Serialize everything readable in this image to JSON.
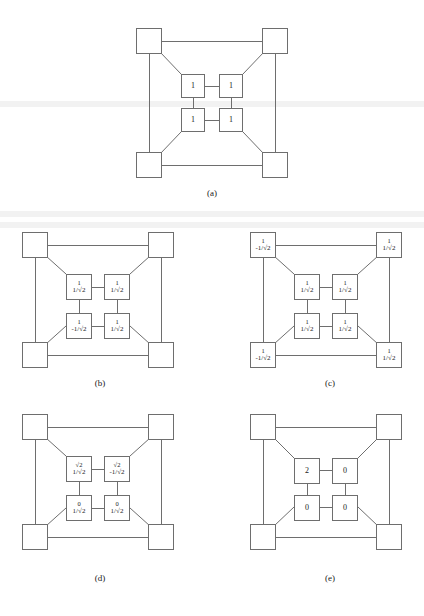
{
  "figure": {
    "background_color": "#ffffff",
    "line_color": "#6e6e6e",
    "text_color": "#1a1a1a"
  },
  "panels": [
    {
      "id": "a",
      "caption": "(a)",
      "corners": [
        {
          "position": "top-left",
          "label": ""
        },
        {
          "position": "top-right",
          "label": ""
        },
        {
          "position": "bottom-left",
          "label": ""
        },
        {
          "position": "bottom-right",
          "label": ""
        }
      ],
      "inner": [
        {
          "position": "top-left",
          "top": "",
          "bottom": "1"
        },
        {
          "position": "top-right",
          "top": "",
          "bottom": "1"
        },
        {
          "position": "bottom-left",
          "top": "",
          "bottom": "1"
        },
        {
          "position": "bottom-right",
          "top": "",
          "bottom": "1"
        }
      ]
    },
    {
      "id": "b",
      "caption": "(b)",
      "corners": [
        {
          "position": "top-left",
          "top": "",
          "bottom": ""
        },
        {
          "position": "top-right",
          "top": "",
          "bottom": ""
        },
        {
          "position": "bottom-left",
          "top": "",
          "bottom": ""
        },
        {
          "position": "bottom-right",
          "top": "",
          "bottom": ""
        }
      ],
      "inner": [
        {
          "position": "top-left",
          "top": "1",
          "bottom": "1/√2"
        },
        {
          "position": "top-right",
          "top": "1",
          "bottom": "1/√2"
        },
        {
          "position": "bottom-left",
          "top": "1",
          "bottom": "-1/√2"
        },
        {
          "position": "bottom-right",
          "top": "1",
          "bottom": "1/√2"
        }
      ]
    },
    {
      "id": "c",
      "caption": "(c)",
      "corners": [
        {
          "position": "top-left",
          "top": "1",
          "bottom": "-1/√2"
        },
        {
          "position": "top-right",
          "top": "1",
          "bottom": "1/√2"
        },
        {
          "position": "bottom-left",
          "top": "1",
          "bottom": "-1/√2"
        },
        {
          "position": "bottom-right",
          "top": "1",
          "bottom": "1/√2"
        }
      ],
      "inner": [
        {
          "position": "top-left",
          "top": "1",
          "bottom": "1/√2"
        },
        {
          "position": "top-right",
          "top": "1",
          "bottom": "1/√2"
        },
        {
          "position": "bottom-left",
          "top": "1",
          "bottom": "1/√2"
        },
        {
          "position": "bottom-right",
          "top": "1",
          "bottom": "1/√2"
        }
      ]
    },
    {
      "id": "d",
      "caption": "(d)",
      "corners": [
        {
          "position": "top-left",
          "top": "",
          "bottom": ""
        },
        {
          "position": "top-right",
          "top": "",
          "bottom": ""
        },
        {
          "position": "bottom-left",
          "top": "",
          "bottom": ""
        },
        {
          "position": "bottom-right",
          "top": "",
          "bottom": ""
        }
      ],
      "inner": [
        {
          "position": "top-left",
          "top": "√2",
          "bottom": "1/√2"
        },
        {
          "position": "top-right",
          "top": "√2",
          "bottom": "-1/√2"
        },
        {
          "position": "bottom-left",
          "top": "0",
          "bottom": "1/√2"
        },
        {
          "position": "bottom-right",
          "top": "0",
          "bottom": "1/√2"
        }
      ]
    },
    {
      "id": "e",
      "caption": "(e)",
      "corners": [
        {
          "position": "top-left",
          "top": "",
          "bottom": ""
        },
        {
          "position": "top-right",
          "top": "",
          "bottom": ""
        },
        {
          "position": "bottom-left",
          "top": "",
          "bottom": ""
        },
        {
          "position": "bottom-right",
          "top": "",
          "bottom": ""
        }
      ],
      "inner": [
        {
          "position": "top-left",
          "top": "",
          "bottom": "2"
        },
        {
          "position": "top-right",
          "top": "",
          "bottom": "0"
        },
        {
          "position": "bottom-left",
          "top": "",
          "bottom": "0"
        },
        {
          "position": "bottom-right",
          "top": "",
          "bottom": "0"
        }
      ]
    }
  ]
}
